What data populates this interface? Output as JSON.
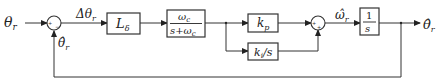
{
  "diagram": {
    "type": "control-block-diagram",
    "input": {
      "label": "θr",
      "symbol": "θ",
      "sub": "r"
    },
    "output": {
      "label": "θ̂r",
      "symbol": "θ̂",
      "sub": "r"
    },
    "sum1": {
      "signs": [
        "+",
        "−"
      ]
    },
    "error_signal": {
      "symbol": "Δθ",
      "sub": "r"
    },
    "feedback_signal": {
      "symbol": "θ̂",
      "sub": "r"
    },
    "blocks": [
      {
        "id": "L_delta",
        "symbol": "L",
        "sub": "δ"
      },
      {
        "id": "lowpass",
        "numerator": "ωc",
        "num_symbol": "ω",
        "num_sub": "c",
        "denominator": "s+ωc",
        "den_pre": "s+ω",
        "den_sub": "c"
      },
      {
        "id": "kp",
        "symbol": "k",
        "sub": "p"
      },
      {
        "id": "ki_over_s",
        "symbol": "k",
        "sub": "i",
        "suffix": "/s"
      },
      {
        "id": "integrator",
        "numerator": "1",
        "denominator": "s"
      }
    ],
    "sum2": {
      "signs": [
        "+",
        "+"
      ]
    },
    "speed_signal": {
      "symbol": "ω̂",
      "sub": "r"
    }
  }
}
